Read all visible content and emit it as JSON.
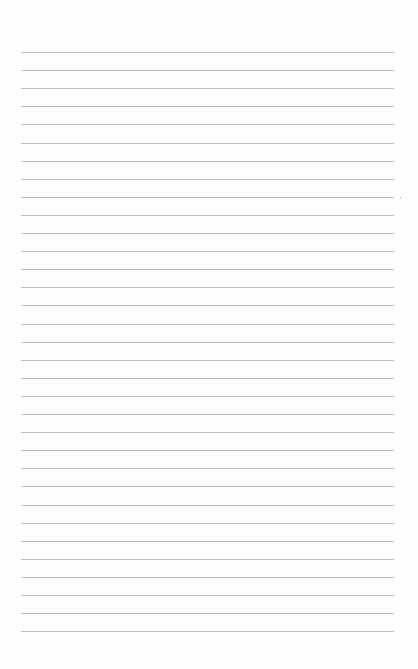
{
  "page": {
    "type": "blank lined paper",
    "background_color": "#fefefe",
    "rule_color": "#bdbdbd",
    "rule_count": 33,
    "first_rule_y": 52,
    "rule_spacing": 18.1,
    "rule_left": 21,
    "rule_right": 394
  }
}
